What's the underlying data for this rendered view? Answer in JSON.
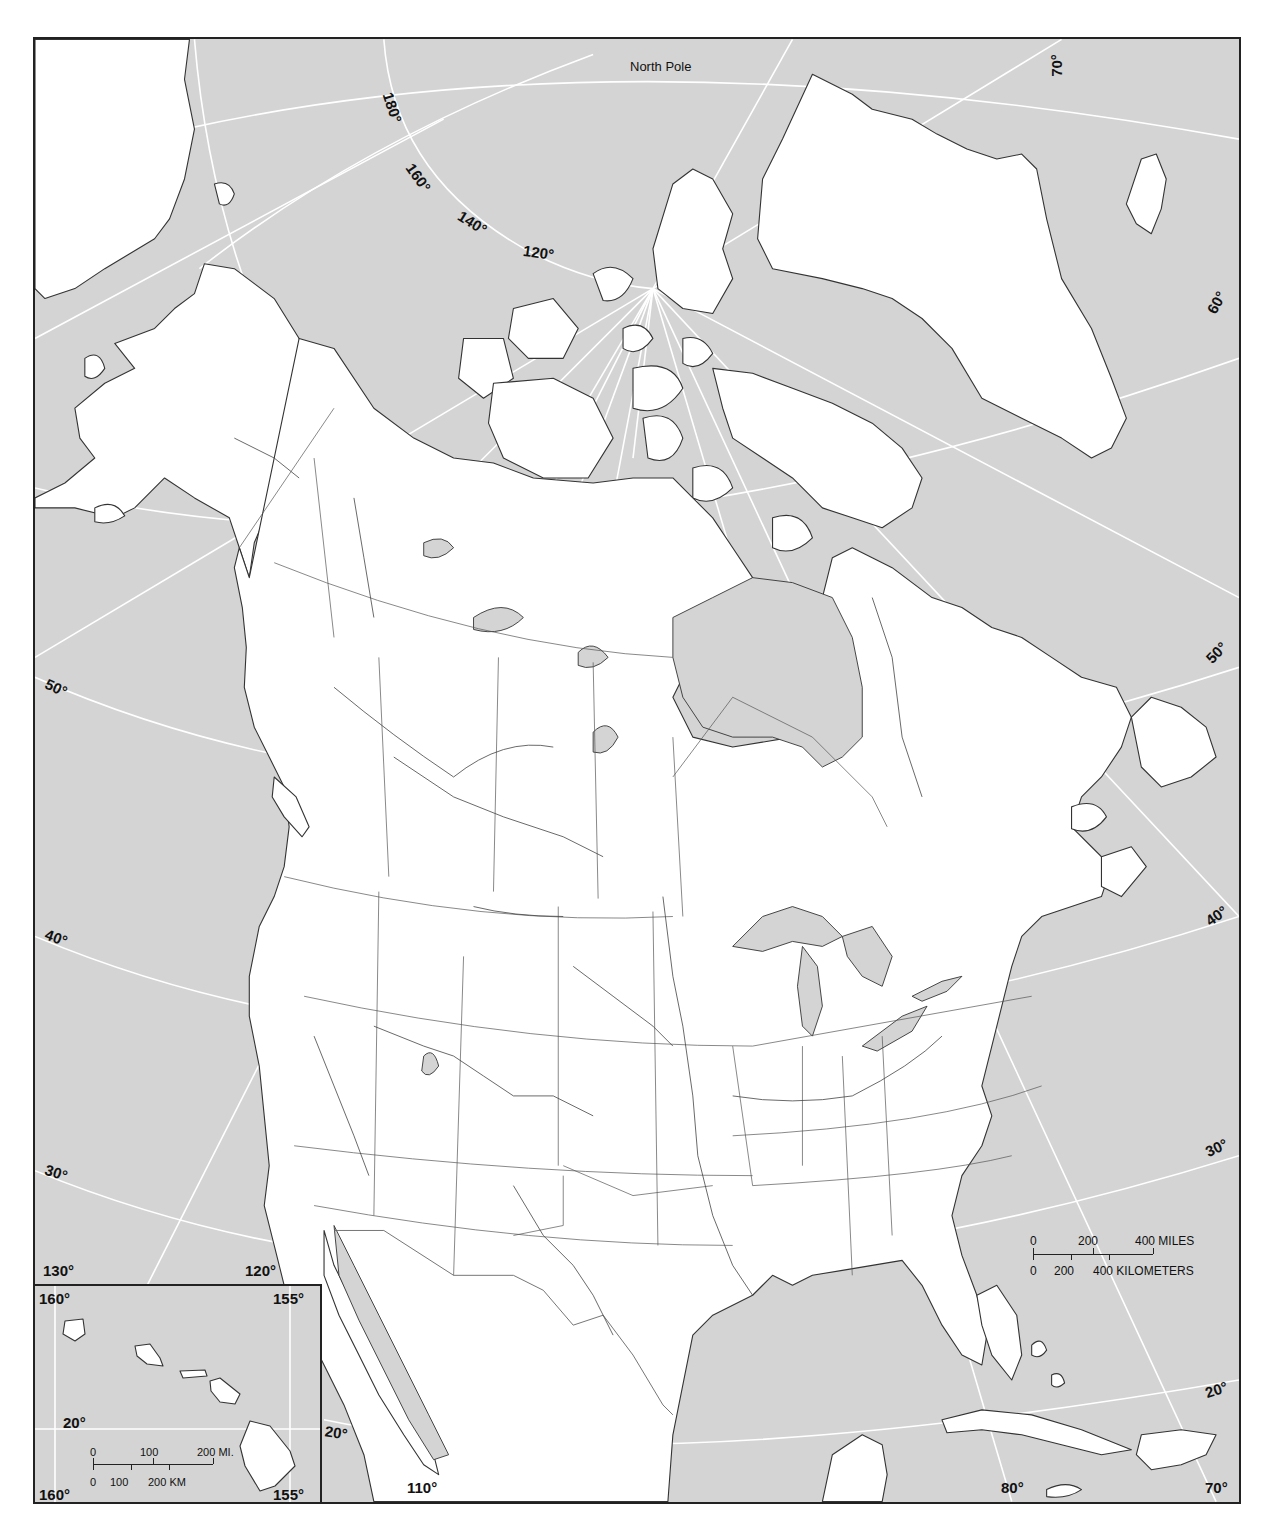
{
  "map": {
    "title": "North America outline map",
    "colors": {
      "ocean": "#d4d4d4",
      "land": "#ffffff",
      "outline": "#333333",
      "graticule": "#ffffff"
    },
    "labels": {
      "north_pole": "North Pole",
      "meridians": {
        "top_180": "180°",
        "top_160": "160°",
        "top_140": "140°",
        "top_120": "120°",
        "top_70": "70°",
        "bottom_130": "130°",
        "bottom_120": "120°",
        "bottom_110": "110°",
        "bottom_80": "80°",
        "bottom_70": "70°"
      },
      "parallels": {
        "left_50": "50°",
        "left_40": "40°",
        "left_30": "30°",
        "left_20": "20°",
        "right_60": "60°",
        "right_50": "50°",
        "right_40": "40°",
        "right_30": "30°",
        "right_20": "20°"
      }
    },
    "scale_bar": {
      "miles_labels": [
        "0",
        "200",
        "400 MILES"
      ],
      "km_labels": [
        "0",
        "200",
        "400 KILOMETERS"
      ]
    },
    "inset": {
      "name": "Hawaii inset",
      "labels": {
        "top_left": "160°",
        "top_right": "155°",
        "bottom_left": "160°",
        "bottom_right": "155°",
        "parallel": "20°"
      },
      "scale_bar": {
        "miles_labels": [
          "0",
          "100",
          "200 MI."
        ],
        "km_labels": [
          "0",
          "100",
          "200 KM"
        ]
      }
    }
  }
}
